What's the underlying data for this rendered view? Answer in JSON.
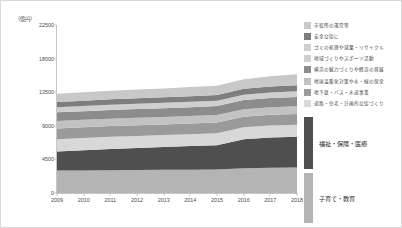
{
  "chart_data": {
    "type": "area",
    "title": "",
    "xlabel": "",
    "ylabel": "",
    "yunit": "（億円）",
    "grid": false,
    "legend_position": "right",
    "categories": [
      "2009",
      "2010",
      "2011",
      "2012",
      "2013",
      "2014",
      "2015",
      "2016",
      "2017",
      "2018"
    ],
    "yticks": [
      "0",
      "4500",
      "9000",
      "13500",
      "18000",
      "22500"
    ],
    "ylim": [
      0,
      22500
    ],
    "stacked": true,
    "series": [
      {
        "name": "子育て・教育",
        "color": "#b4b4b4",
        "values": [
          3000,
          3020,
          3050,
          3080,
          3100,
          3130,
          3160,
          3300,
          3380,
          3420
        ]
      },
      {
        "name": "福祉・保険・医療",
        "color": "#4f4f4f",
        "values": [
          2550,
          2700,
          2850,
          2950,
          3050,
          3150,
          3250,
          3900,
          4050,
          4100
        ]
      },
      {
        "name": "道路・住宅・計画的な街づくり",
        "color": "#d8d8d8",
        "values": [
          1650,
          1640,
          1630,
          1620,
          1610,
          1600,
          1600,
          1600,
          1620,
          1630
        ]
      },
      {
        "name": "地下鉄・バス・水道事業",
        "color": "#9a9a9a",
        "values": [
          1450,
          1440,
          1430,
          1430,
          1420,
          1420,
          1420,
          1420,
          1430,
          1440
        ]
      },
      {
        "name": "地球温暖化対策や水・緑の保全",
        "color": "#c2c2c2",
        "values": [
          1000,
          1000,
          1000,
          1000,
          1000,
          1000,
          1010,
          1010,
          1020,
          1030
        ]
      },
      {
        "name": "横浜の魅力づくりや経済の発展",
        "color": "#8c8c8c",
        "values": [
          1150,
          1150,
          1160,
          1170,
          1180,
          1190,
          1200,
          1210,
          1230,
          1250
        ]
      },
      {
        "name": "地域づくりやスポーツ活動",
        "color": "#cfcfcf",
        "values": [
          700,
          700,
          705,
          710,
          715,
          720,
          725,
          730,
          740,
          750
        ]
      },
      {
        "name": "安全な街に",
        "color": "#7e7e7e",
        "values": [
          700,
          710,
          720,
          730,
          740,
          750,
          760,
          780,
          800,
          820
        ]
      },
      {
        "name": "市役所の運営等",
        "color": "#c8c8c8",
        "values": [
          1100,
          1120,
          1140,
          1160,
          1190,
          1220,
          1250,
          1300,
          1380,
          1460
        ]
      }
    ]
  },
  "legend": {
    "small_items": [
      {
        "label": "市役所の運営等",
        "color": "#c8c8c8"
      },
      {
        "label": "安全な街に",
        "color": "#7e7e7e"
      },
      {
        "label": "ゴミの処理や減量・リサイクル",
        "color": "#cfcfcf"
      },
      {
        "label": "地域づくりやスポーツ活動",
        "color": "#cfcfcf"
      },
      {
        "label": "横浜の魅力づくりや経済の発展",
        "color": "#8c8c8c"
      },
      {
        "label": "地球温暖化対策や水・緑の保全",
        "color": "#c2c2c2"
      },
      {
        "label": "地下鉄・バス・水道事業",
        "color": "#9a9a9a"
      },
      {
        "label": "道路・住宅・計画的な街づくり",
        "color": "#d8d8d8"
      }
    ],
    "big_items": [
      {
        "label": "福祉・保険・医療",
        "color": "#4f4f4f"
      },
      {
        "label": "子育て・教育",
        "color": "#b4b4b4"
      }
    ]
  }
}
